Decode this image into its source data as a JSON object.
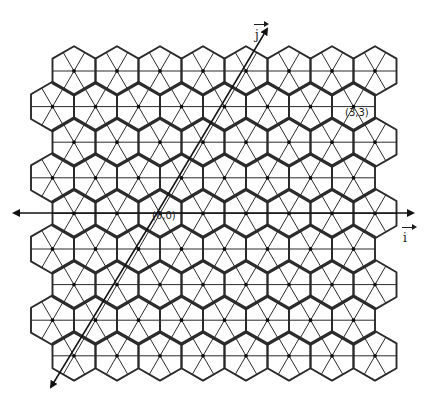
{
  "diagram": {
    "type": "hexagonal-lattice",
    "rows": 9,
    "hexes_per_row": 8,
    "line_color": "#2a2a2a",
    "labels": {
      "origin": "(0,0)",
      "point": "(3,3)",
      "i_axis": "i",
      "j_axis": "j"
    }
  }
}
